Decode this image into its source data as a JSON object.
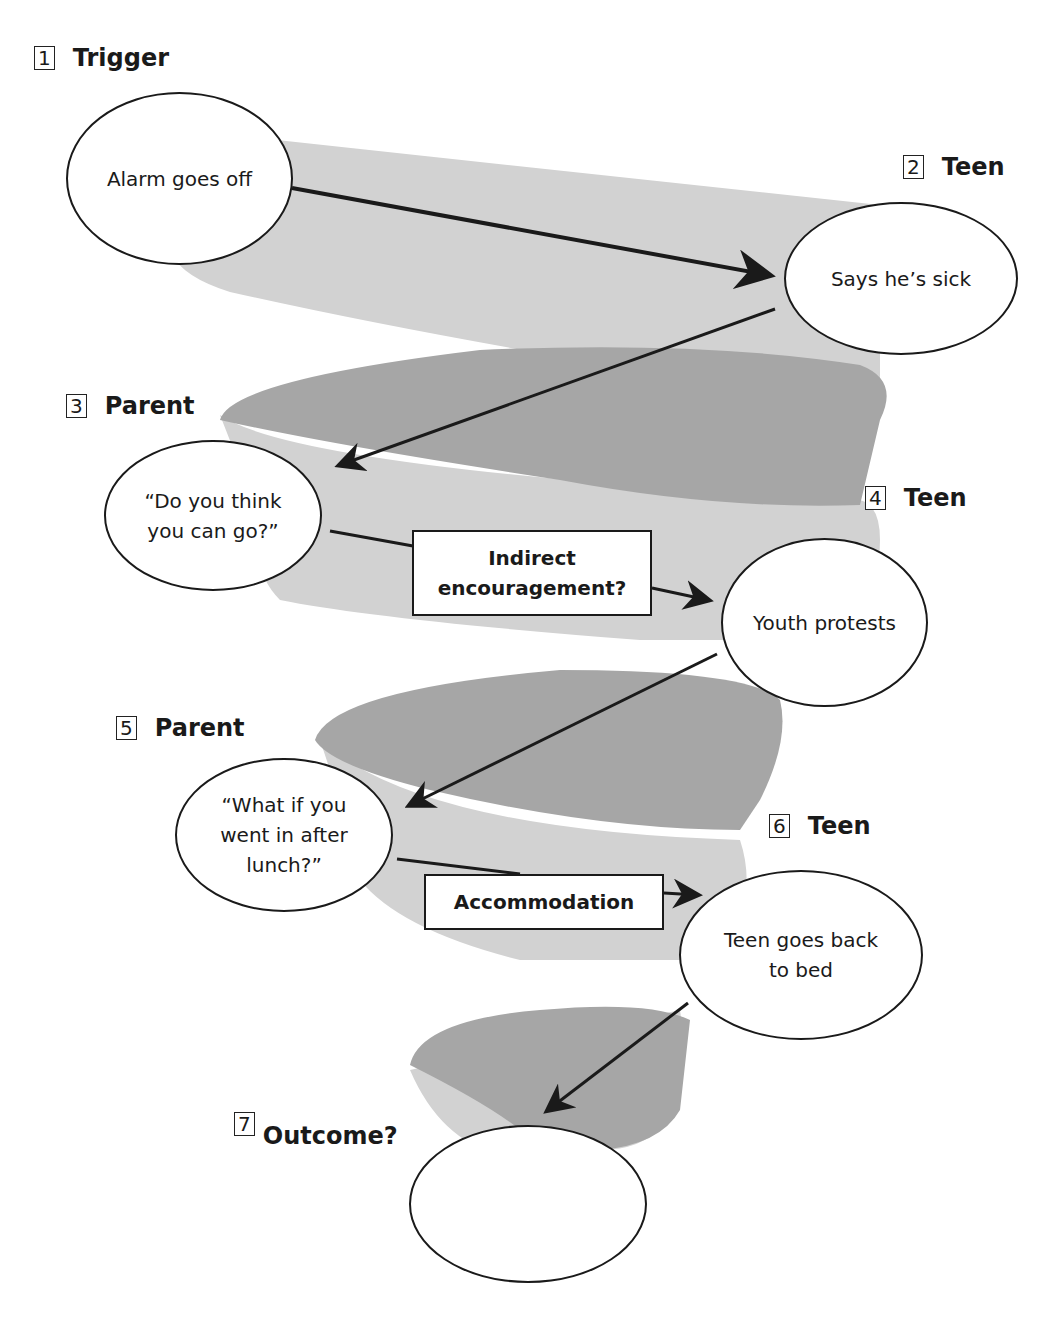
{
  "steps": [
    {
      "num": "1",
      "role": "Trigger",
      "node": "Alarm goes off"
    },
    {
      "num": "2",
      "role": "Teen",
      "node": "Says he’s sick"
    },
    {
      "num": "3",
      "role": "Parent",
      "node_line1": "“Do you think",
      "node_line2": "you can go?”"
    },
    {
      "num": "4",
      "role": "Teen",
      "node": "Youth protests"
    },
    {
      "num": "5",
      "role": "Parent",
      "node_line1": "“What if you",
      "node_line2": "went in after",
      "node_line3": "lunch?”"
    },
    {
      "num": "6",
      "role": "Teen",
      "node_line1": "Teen goes back",
      "node_line2": "to bed"
    },
    {
      "num": "7",
      "role": "Outcome?",
      "node": ""
    }
  ],
  "labels": {
    "indirect_line1": "Indirect",
    "indirect_line2": "encouragement?",
    "accommodation": "Accommodation"
  },
  "colors": {
    "ribbon_light": "#d2d2d2",
    "ribbon_dark": "#a6a6a6",
    "stroke": "#1a1a1a"
  }
}
